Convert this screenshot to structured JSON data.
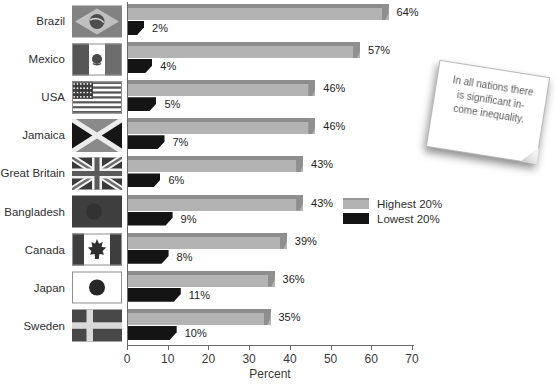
{
  "chart_data": {
    "type": "bar",
    "orientation": "horizontal",
    "title": "",
    "categories": [
      "Brazil",
      "Mexico",
      "USA",
      "Jamaica",
      "Great Britain",
      "Bangladesh",
      "Canada",
      "Japan",
      "Sweden"
    ],
    "series": [
      {
        "name": "Highest 20%",
        "color": "#b3b3b3",
        "values": [
          64,
          57,
          46,
          46,
          43,
          43,
          39,
          36,
          35
        ]
      },
      {
        "name": "Lowest 20%",
        "color": "#141414",
        "values": [
          2,
          4,
          5,
          7,
          6,
          9,
          8,
          11,
          10
        ]
      }
    ],
    "value_label_format": "{v}%",
    "xlabel": "Percent",
    "xlim": [
      0,
      70
    ],
    "xticks": [
      0,
      10,
      20,
      30,
      40,
      50,
      60,
      70
    ],
    "grid": false,
    "legend_position": "middle-right",
    "flags": [
      "brazil",
      "mexico",
      "usa",
      "jamaica",
      "great-britain",
      "bangladesh",
      "canada",
      "japan",
      "sweden"
    ]
  },
  "legend": {
    "items": [
      {
        "label": "Highest 20%",
        "color": "#b3b3b3"
      },
      {
        "label": "Lowest 20%",
        "color": "#141414"
      }
    ]
  },
  "note": {
    "lines": [
      "In all nations there",
      "is significant in-",
      "come inequality."
    ]
  }
}
